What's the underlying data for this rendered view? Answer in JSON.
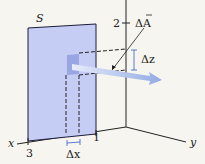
{
  "diagram": {
    "surface_label": "S",
    "axis_labels": {
      "x": "x",
      "y": "y",
      "z_tick": "2"
    },
    "tick_labels": {
      "x_tick_3": "3",
      "x_tick_1": "1"
    },
    "area_vector_label": "ΔA",
    "delta_z_label": "Δz",
    "delta_x_label": "Δx"
  },
  "colors": {
    "background": "#f6f5ef",
    "surface_fill": "#c6cdf4",
    "surface_stroke": "#1c1c3a",
    "patch_fill": "#8fa0e0",
    "arrow_fill": "#a9bbe8",
    "dimension": "#3a5bc7",
    "axis": "#222222"
  }
}
